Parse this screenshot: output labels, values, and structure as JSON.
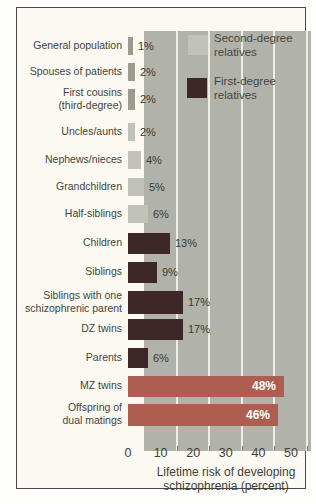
{
  "colors": {
    "page_bg": "#fdfdfb",
    "frame_bg": "#fbf9f2",
    "frame_border": "#4a4a46",
    "panel_bg": "#b1b3aa",
    "gridline": "#eceee6",
    "baseline_bar": "#9a9c91",
    "second_degree_bar": "#c1c3b9",
    "first_degree_bar": "#3e2728",
    "highlight_bar": "#ae5e51",
    "text": "#45453d",
    "inside_label_text": "#ffffff"
  },
  "legend": {
    "second_degree_label": "Second-degree\nrelatives",
    "first_degree_label": "First-degree\nrelatives"
  },
  "chart_data": {
    "type": "bar",
    "orientation": "horizontal",
    "xlabel": "Lifetime risk of developing\nschizophrenia (percent)",
    "xlim": [
      0,
      50
    ],
    "xticks": [
      0,
      10,
      20,
      30,
      40,
      50
    ],
    "grid": "vertical white gridlines",
    "legend_position": "top-right inside plot",
    "legend_entries": [
      "Second-degree relatives",
      "First-degree relatives"
    ],
    "rows": [
      {
        "label_lines": [
          "General population"
        ],
        "value": 1,
        "pct_label": "1%",
        "group": "baseline",
        "label_inside": false
      },
      {
        "label_lines": [
          "Spouses of patients"
        ],
        "value": 2,
        "pct_label": "2%",
        "group": "baseline",
        "label_inside": false
      },
      {
        "label_lines": [
          "First cousins",
          "(third-degree)"
        ],
        "value": 2,
        "pct_label": "2%",
        "group": "baseline",
        "label_inside": false
      },
      {
        "label_lines": [
          "Uncles/aunts"
        ],
        "value": 2,
        "pct_label": "2%",
        "group": "second-degree",
        "label_inside": false
      },
      {
        "label_lines": [
          "Nephews/nieces"
        ],
        "value": 4,
        "pct_label": "4%",
        "group": "second-degree",
        "label_inside": false
      },
      {
        "label_lines": [
          "Grandchildren"
        ],
        "value": 5,
        "pct_label": "5%",
        "group": "second-degree",
        "label_inside": false
      },
      {
        "label_lines": [
          "Half-siblings"
        ],
        "value": 6,
        "pct_label": "6%",
        "group": "second-degree",
        "label_inside": false
      },
      {
        "label_lines": [
          "Children"
        ],
        "value": 13,
        "pct_label": "13%",
        "group": "first-degree",
        "label_inside": false
      },
      {
        "label_lines": [
          "Siblings"
        ],
        "value": 9,
        "pct_label": "9%",
        "group": "first-degree",
        "label_inside": false
      },
      {
        "label_lines": [
          "Siblings with one",
          "schizophrenic parent"
        ],
        "value": 17,
        "pct_label": "17%",
        "group": "first-degree",
        "label_inside": false
      },
      {
        "label_lines": [
          "DZ twins"
        ],
        "value": 17,
        "pct_label": "17%",
        "group": "first-degree",
        "label_inside": false
      },
      {
        "label_lines": [
          "Parents"
        ],
        "value": 6,
        "pct_label": "6%",
        "group": "first-degree",
        "label_inside": false
      },
      {
        "label_lines": [
          "MZ twins"
        ],
        "value": 48,
        "pct_label": "48%",
        "group": "highlight",
        "label_inside": true
      },
      {
        "label_lines": [
          "Offspring of",
          "dual matings"
        ],
        "value": 46,
        "pct_label": "46%",
        "group": "highlight",
        "label_inside": true
      }
    ]
  }
}
